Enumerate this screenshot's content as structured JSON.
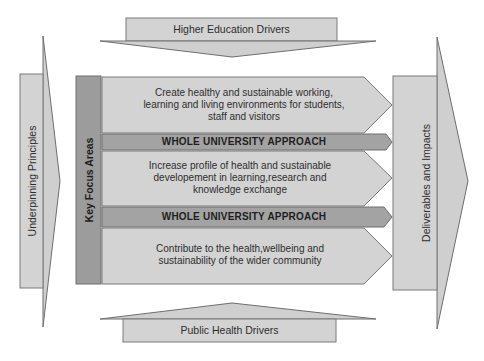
{
  "diagram": {
    "top_driver": {
      "label": "Higher Education Drivers"
    },
    "bottom_driver": {
      "label": "Public Health Drivers"
    },
    "left_principles": {
      "label": "Underpinning Principles"
    },
    "right_outputs": {
      "label": "Deliverables and Impacts"
    },
    "key_focus": {
      "label": "Key Focus Areas"
    },
    "focus_areas": [
      {
        "lines": [
          "Create healthy and sustainable working,",
          "learning and living environments for students,",
          "staff and visitors"
        ]
      },
      {
        "lines": [
          "Increase profile of health and sustainable",
          "developement in learning,research and",
          "knowledge exchange"
        ]
      },
      {
        "lines": [
          "Contribute to the health,wellbeing and",
          "sustainability of the wider community"
        ]
      }
    ],
    "approach_bands": [
      {
        "label": "WHOLE UNIVERSITY APPROACH"
      },
      {
        "label": "WHOLE UNIVERSITY APPROACH"
      }
    ],
    "colors": {
      "light_fill": "#d3d3d3",
      "medium_fill": "#b5b5b5",
      "dark_fill": "#9c9c9c",
      "stroke": "#6e6e6e"
    }
  }
}
